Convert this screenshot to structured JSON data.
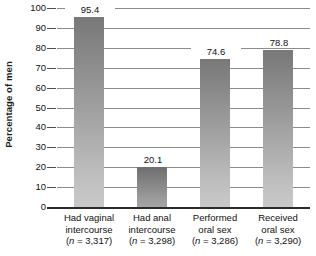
{
  "chart_data": {
    "type": "bar",
    "title": "",
    "xlabel": "",
    "ylabel": "Percentage of men",
    "ylim": [
      0,
      100
    ],
    "ytick_labels": [
      "100",
      "90",
      "80",
      "70",
      "60",
      "50",
      "40",
      "30",
      "20",
      "10",
      "0"
    ],
    "ytick_values": [
      100,
      90,
      80,
      70,
      60,
      50,
      40,
      30,
      20,
      10,
      0
    ],
    "grid": true,
    "legend": "none",
    "categories": [
      "Had vaginal intercourse (n = 3,317)",
      "Had anal intercourse (n = 3,298)",
      "Performed oral sex (n = 3,286)",
      "Received oral sex (n = 3,290)"
    ],
    "values": [
      95.4,
      20.1,
      74.6,
      78.8
    ],
    "value_labels": [
      "95.4",
      "20.1",
      "74.6",
      "78.8"
    ],
    "category_lines": [
      {
        "line1": "Had vaginal",
        "line2": "intercourse",
        "line3_prefix": "(",
        "line3_italic": "n",
        "line3_suffix": " = 3,317)"
      },
      {
        "line1": "Had anal",
        "line2": "intercourse",
        "line3_prefix": "(",
        "line3_italic": "n",
        "line3_suffix": " = 3,298)"
      },
      {
        "line1": "Performed",
        "line2": "oral sex",
        "line3_prefix": "(",
        "line3_italic": "n",
        "line3_suffix": " = 3,286)"
      },
      {
        "line1": "Received",
        "line2": "oral sex",
        "line3_prefix": "(",
        "line3_italic": "n",
        "line3_suffix": " = 3,290)"
      }
    ],
    "colors": {
      "bar_top": "#787878",
      "bar_bottom": "#c9c9c9",
      "gridline": "#8c8c8c",
      "axis": "#2b2b2b",
      "text": "#111111"
    }
  }
}
